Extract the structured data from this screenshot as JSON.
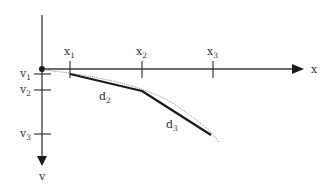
{
  "diagram": {
    "colors": {
      "axis": "#3a3a3a",
      "path": "#1a1a1a",
      "curve": "#9a9a9a",
      "text": "#333333"
    },
    "axes": {
      "x_label": "x",
      "v_label": "v"
    },
    "x_ticks": [
      {
        "base": "x",
        "sub": "1"
      },
      {
        "base": "x",
        "sub": "2"
      },
      {
        "base": "x",
        "sub": "3"
      }
    ],
    "v_ticks": [
      {
        "base": "v",
        "sub": "1"
      },
      {
        "base": "v",
        "sub": "2"
      },
      {
        "base": "v",
        "sub": "3"
      }
    ],
    "segments": [
      {
        "base": "d",
        "sub": "2"
      },
      {
        "base": "d",
        "sub": "3"
      }
    ]
  }
}
